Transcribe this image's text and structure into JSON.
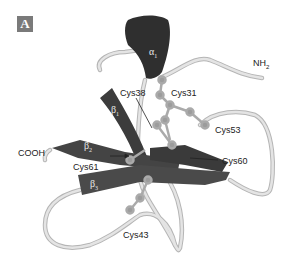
{
  "panel": {
    "label": "A"
  },
  "labels": {
    "nh2": "NH",
    "nh2_sub": "2",
    "cooh": "COOH",
    "cys31": "Cys31",
    "cys38": "Cys38",
    "cys53": "Cys53",
    "cys60": "Cys60",
    "cys61": "Cys61",
    "cys43": "Cys43"
  },
  "secondary_structure": {
    "alpha1": {
      "symbol": "α",
      "sub": "1"
    },
    "beta1": {
      "symbol": "β",
      "sub": "1"
    },
    "beta2": {
      "symbol": "β",
      "sub": "2"
    },
    "beta3": {
      "symbol": "β",
      "sub": "3"
    }
  },
  "colors": {
    "ribbon_dark": "#3a3a3a",
    "ribbon_mid": "#5a5a5a",
    "coil": "#d8d8d8",
    "coil_edge": "#b0b0b0",
    "sulfur_ball": "#9a9a9a"
  }
}
